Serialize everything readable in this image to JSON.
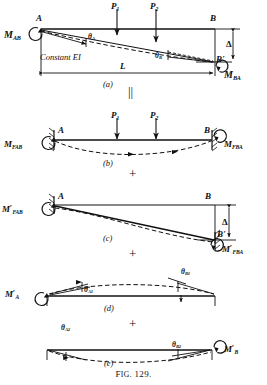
{
  "figure": {
    "caption_prefix": "F",
    "caption_smallcaps": "IG",
    "caption_number": ". 129.",
    "caption_full": "Fig. 129.",
    "line_color": "#111111",
    "background": "#ffffff"
  },
  "operators": {
    "equals": "||",
    "plus_1": "+",
    "plus_2": "+",
    "plus_3": "+"
  },
  "panels": [
    {
      "id": "a",
      "tag": "(a)",
      "note": "Constant EI",
      "labels": {
        "moment_left": {
          "base": "M",
          "sub": "AB",
          "prime": ""
        },
        "moment_right": {
          "base": "M",
          "sub": "BA",
          "prime": ""
        },
        "node_left": "A",
        "node_right": "B",
        "node_right_displaced": "B'",
        "load_1": {
          "base": "P",
          "sub": "1"
        },
        "load_2": {
          "base": "P",
          "sub": "2"
        },
        "theta_left": {
          "base": "θ",
          "sub": "A"
        },
        "theta_right": {
          "base": "θ",
          "sub": "B"
        },
        "span": "L",
        "delta": "Δ"
      }
    },
    {
      "id": "b",
      "tag": "(b)",
      "labels": {
        "moment_left": {
          "base": "M",
          "sub": "FAB",
          "prime": ""
        },
        "moment_right": {
          "base": "M",
          "sub": "FBA",
          "prime": ""
        },
        "node_left": "A",
        "node_right": "B",
        "load_1": {
          "base": "P",
          "sub": "1"
        },
        "load_2": {
          "base": "P",
          "sub": "2"
        }
      }
    },
    {
      "id": "c",
      "tag": "(c)",
      "labels": {
        "moment_left": {
          "base": "M",
          "sub": "FAB",
          "prime": "′"
        },
        "moment_right": {
          "base": "M",
          "sub": "FBA",
          "prime": "′"
        },
        "node_left": "A",
        "node_right": "B",
        "node_right_displaced": "B'",
        "delta": "Δ"
      }
    },
    {
      "id": "d",
      "tag": "(d)",
      "labels": {
        "moment_left": {
          "base": "M",
          "sub": "A",
          "prime": "′"
        },
        "theta_left": {
          "base": "θ",
          "sub": "A1"
        },
        "theta_right": {
          "base": "θ",
          "sub": "B1"
        }
      }
    },
    {
      "id": "e",
      "tag": "(e)",
      "labels": {
        "moment_right": {
          "base": "M",
          "sub": "B",
          "prime": "′"
        },
        "theta_left": {
          "base": "θ",
          "sub": "A2"
        },
        "theta_right": {
          "base": "θ",
          "sub": "B2"
        }
      }
    }
  ]
}
